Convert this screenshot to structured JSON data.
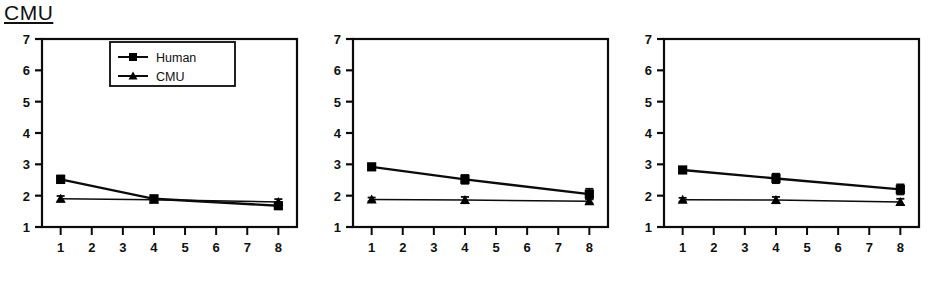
{
  "figure": {
    "title": "CMU",
    "title_underlined": true,
    "panel_count": 3,
    "colors": {
      "ink": "#000000",
      "background": "#ffffff",
      "axis": "#111111"
    }
  },
  "legend": {
    "position": "top-right of first panel",
    "entries": [
      {
        "label": "Human",
        "marker": "square"
      },
      {
        "label": "CMU",
        "marker": "triangle"
      }
    ]
  },
  "axes": {
    "y_ticks": [
      "7",
      "6",
      "5",
      "4",
      "3",
      "2",
      "1"
    ],
    "x_ticks": [
      "1",
      "2",
      "3",
      "4",
      "5",
      "6",
      "7",
      "8"
    ],
    "ylim": [
      1,
      7
    ],
    "xlim": [
      0.4,
      8.6
    ],
    "xlabel": "",
    "ylabel": ""
  },
  "chart_data": [
    {
      "type": "line",
      "panel_index": 1,
      "title": "CMU",
      "xlabel": "",
      "ylabel": "",
      "x": [
        1,
        4,
        8
      ],
      "x_tick_labels": [
        "1",
        "2",
        "3",
        "4",
        "5",
        "6",
        "7",
        "8"
      ],
      "y_tick_labels": [
        "1",
        "2",
        "3",
        "4",
        "5",
        "6",
        "7"
      ],
      "xlim": [
        0.4,
        8.6
      ],
      "ylim": [
        1,
        7
      ],
      "grid": false,
      "legend": [
        "Human",
        "CMU"
      ],
      "legend_position": "upper right",
      "series": [
        {
          "name": "Human",
          "marker": "square",
          "values": [
            2.52,
            1.9,
            1.68
          ],
          "errors": [
            0.12,
            0.08,
            0.11
          ]
        },
        {
          "name": "CMU",
          "marker": "triangle",
          "values": [
            1.9,
            1.87,
            1.8
          ],
          "errors": [
            0.09,
            0.05,
            0.09
          ]
        }
      ]
    },
    {
      "type": "line",
      "panel_index": 2,
      "title": "",
      "xlabel": "",
      "ylabel": "",
      "x": [
        1,
        4,
        8
      ],
      "x_tick_labels": [
        "1",
        "2",
        "3",
        "4",
        "5",
        "6",
        "7",
        "8"
      ],
      "y_tick_labels": [
        "1",
        "2",
        "3",
        "4",
        "5",
        "6",
        "7"
      ],
      "xlim": [
        0.4,
        8.6
      ],
      "ylim": [
        1,
        7
      ],
      "grid": false,
      "legend": [],
      "legend_position": "none",
      "series": [
        {
          "name": "Human",
          "marker": "square",
          "values": [
            2.92,
            2.52,
            2.05
          ],
          "errors": [
            0.07,
            0.14,
            0.17
          ]
        },
        {
          "name": "CMU",
          "marker": "triangle",
          "values": [
            1.88,
            1.86,
            1.82
          ],
          "errors": [
            0.06,
            0.1,
            0.07
          ]
        }
      ]
    },
    {
      "type": "line",
      "panel_index": 3,
      "title": "",
      "xlabel": "",
      "ylabel": "",
      "x": [
        1,
        4,
        8
      ],
      "x_tick_labels": [
        "1",
        "2",
        "3",
        "4",
        "5",
        "6",
        "7",
        "8"
      ],
      "y_tick_labels": [
        "1",
        "2",
        "3",
        "4",
        "5",
        "6",
        "7"
      ],
      "xlim": [
        0.4,
        8.6
      ],
      "ylim": [
        1,
        7
      ],
      "grid": false,
      "legend": [],
      "legend_position": "none",
      "series": [
        {
          "name": "Human",
          "marker": "square",
          "values": [
            2.82,
            2.55,
            2.2
          ],
          "errors": [
            0.08,
            0.15,
            0.16
          ]
        },
        {
          "name": "CMU",
          "marker": "triangle",
          "values": [
            1.87,
            1.86,
            1.8
          ],
          "errors": [
            0.06,
            0.1,
            0.1
          ]
        }
      ]
    }
  ]
}
